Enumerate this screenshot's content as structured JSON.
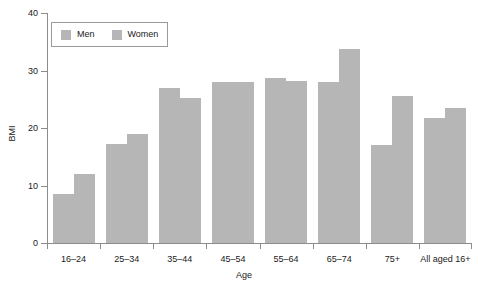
{
  "chart_data": {
    "type": "bar",
    "title": "",
    "subtitle": "",
    "xlabel": "Age",
    "ylabel": "BMI",
    "ylim": [
      0,
      40
    ],
    "yticks": [
      0,
      10,
      20,
      30,
      40
    ],
    "grid": false,
    "legend_position": "top-left",
    "bar_color": "#b6b6b6",
    "axis_color": "#8c8c8c",
    "categories": [
      "16–24",
      "25–34",
      "35–44",
      "45–54",
      "55–64",
      "65–74",
      "75+",
      "All aged 16+"
    ],
    "series": [
      {
        "name": "Men",
        "values": [
          8.5,
          17.2,
          27.0,
          28.0,
          28.7,
          28.0,
          17.0,
          21.8
        ]
      },
      {
        "name": "Women",
        "values": [
          12.0,
          19.0,
          25.2,
          28.0,
          28.1,
          33.8,
          25.5,
          23.5
        ]
      }
    ]
  },
  "legend": {
    "entries": [
      {
        "label": "Men",
        "swatch": "legend-swatch-men"
      },
      {
        "label": "Women",
        "swatch": "legend-swatch-women"
      }
    ]
  }
}
